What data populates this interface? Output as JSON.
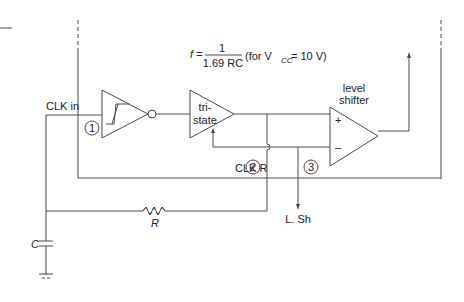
{
  "diagram": {
    "formula": {
      "lhs": "f =",
      "numerator": "1",
      "denominator": "1.69 RC",
      "condition_prefix": "(for V",
      "condition_sub": "CC",
      "condition_suffix": " = 10 V)"
    },
    "labels": {
      "clk_in": "CLK in",
      "clk_r": "CLK R",
      "tristate_line1": "tri-",
      "tristate_line2": "state",
      "level_shifter_line1": "level",
      "level_shifter_line2": "shifter",
      "plus": "+",
      "minus": "–",
      "resistor": "R",
      "capacitor": "C",
      "level_shift_out": "L. Sh"
    },
    "nodes": [
      "1",
      "2",
      "3"
    ],
    "components": [
      {
        "type": "schmitt-trigger-inverter"
      },
      {
        "type": "tristate-buffer"
      },
      {
        "type": "comparator",
        "name": "level shifter"
      },
      {
        "type": "resistor",
        "label": "R"
      },
      {
        "type": "capacitor",
        "label": "C"
      },
      {
        "type": "ground"
      }
    ],
    "colors": {
      "line": "#4a4a4a",
      "text": "#222222",
      "background": "#ffffff"
    }
  }
}
